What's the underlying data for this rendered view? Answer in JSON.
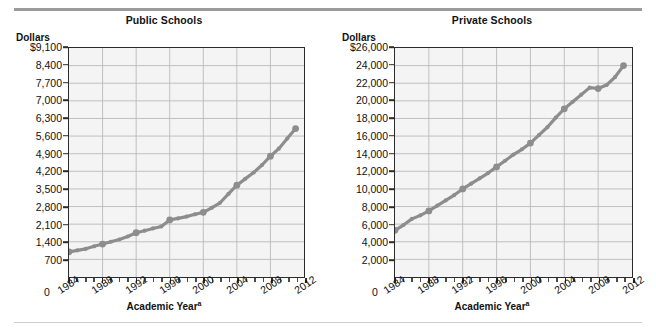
{
  "figure": {
    "panels": [
      {
        "key": "public",
        "title": "Public Schools",
        "y_axis_unit": "Dollars",
        "x_axis_title": "Academic Year",
        "x_axis_title_note": "a",
        "y_zero_label": "0",
        "y_tick_labels": [
          "$9,100",
          "8,400",
          "7,700",
          "7,000",
          "6,300",
          "5,600",
          "4,900",
          "4,200",
          "3,500",
          "2,800",
          "2,100",
          "1,400",
          "700"
        ],
        "x_tick_labels": [
          "1984",
          "1988",
          "1992",
          "1996",
          "2000",
          "2004",
          "2008",
          "2012"
        ]
      },
      {
        "key": "private",
        "title": "Private Schools",
        "y_axis_unit": "Dollars",
        "x_axis_title": "Academic Year",
        "x_axis_title_note": "a",
        "y_zero_label": "0",
        "y_tick_labels": [
          "$26,000",
          "24,000",
          "22,000",
          "20,000",
          "18,000",
          "16,000",
          "14,000",
          "12,000",
          "10,000",
          "8,000",
          "6,000",
          "4,000",
          "2,000"
        ],
        "x_tick_labels": [
          "1984",
          "1988",
          "1992",
          "1996",
          "2000",
          "2004",
          "2008",
          "2012"
        ]
      }
    ],
    "colors": {
      "series": "#8d8d8d",
      "plot_background": "#f4f4f4",
      "grid": "#b9b9b9",
      "axis": "#2b2b2b",
      "rule_top": "#9b9b9b",
      "rule_bottom": "#cfcfcf"
    }
  },
  "chart_data": [
    {
      "type": "line",
      "title": "Public Schools",
      "xlabel": "Academic Year",
      "ylabel": "Dollars",
      "xlim": [
        1984,
        2012
      ],
      "ylim": [
        0,
        9100
      ],
      "ytick_step": 700,
      "xtick_step": 4,
      "grid": true,
      "legend": "none",
      "x": [
        1984,
        1985,
        1986,
        1987,
        1988,
        1989,
        1990,
        1991,
        1992,
        1993,
        1994,
        1995,
        1996,
        1997,
        1998,
        1999,
        2000,
        2001,
        2002,
        2003,
        2004,
        2005,
        2006,
        2007,
        2008,
        2009,
        2010,
        2011
      ],
      "values": [
        1000,
        1060,
        1120,
        1220,
        1310,
        1400,
        1490,
        1610,
        1760,
        1840,
        1930,
        2010,
        2270,
        2330,
        2400,
        2490,
        2570,
        2750,
        2950,
        3300,
        3650,
        3900,
        4150,
        4450,
        4800,
        5100,
        5500,
        5900
      ],
      "labeled_points": {
        "1984": 1000,
        "1988": 1310,
        "1992": 1760,
        "1996": 2270,
        "2000": 2570,
        "2004": 3650,
        "2008": 4800,
        "2011": 5900
      },
      "series": [
        {
          "name": "Public Schools average tuition",
          "values": [
            1000,
            1060,
            1120,
            1220,
            1310,
            1400,
            1490,
            1610,
            1760,
            1840,
            1930,
            2010,
            2270,
            2330,
            2400,
            2490,
            2570,
            2750,
            2950,
            3300,
            3650,
            3900,
            4150,
            4450,
            4800,
            5100,
            5500,
            5900
          ]
        }
      ]
    },
    {
      "type": "line",
      "title": "Private Schools",
      "xlabel": "Academic Year",
      "ylabel": "Dollars",
      "xlim": [
        1984,
        2012
      ],
      "ylim": [
        0,
        26000
      ],
      "ytick_step": 2000,
      "xtick_step": 4,
      "grid": true,
      "legend": "none",
      "x": [
        1984,
        1985,
        1986,
        1987,
        1988,
        1989,
        1990,
        1991,
        1992,
        1993,
        1994,
        1995,
        1996,
        1997,
        1998,
        1999,
        2000,
        2001,
        2002,
        2003,
        2004,
        2005,
        2006,
        2007,
        2008,
        2009,
        2010,
        2011
      ],
      "values": [
        5300,
        5900,
        6600,
        7000,
        7500,
        8100,
        8700,
        9300,
        10000,
        10600,
        11200,
        11800,
        12500,
        13200,
        13900,
        14500,
        15200,
        16100,
        17000,
        18100,
        19100,
        19900,
        20700,
        21500,
        21400,
        21800,
        22700,
        24000
      ],
      "labeled_points": {
        "1984": 5300,
        "1988": 7500,
        "1992": 10000,
        "1996": 12500,
        "2000": 15200,
        "2004": 19100,
        "2008": 21400,
        "2011": 24000
      },
      "series": [
        {
          "name": "Private Schools average tuition",
          "values": [
            5300,
            5900,
            6600,
            7000,
            7500,
            8100,
            8700,
            9300,
            10000,
            10600,
            11200,
            11800,
            12500,
            13200,
            13900,
            14500,
            15200,
            16100,
            17000,
            18100,
            19100,
            19900,
            20700,
            21500,
            21400,
            21800,
            22700,
            24000
          ]
        }
      ]
    }
  ]
}
